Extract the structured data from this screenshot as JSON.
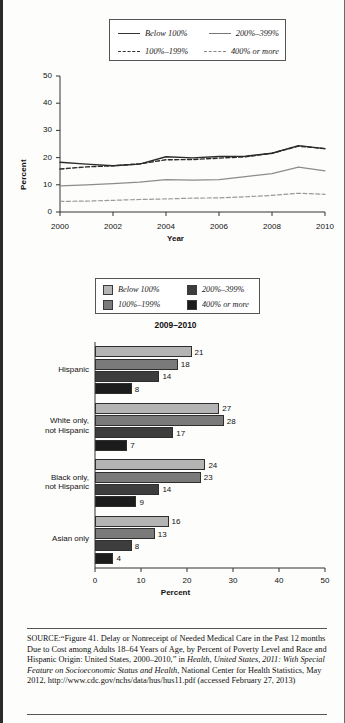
{
  "line_chart_legend": [
    {
      "label": "Below 100%",
      "style": "solid-dark"
    },
    {
      "label": "200%–399%",
      "style": "solid-light"
    },
    {
      "label": "100%–199%",
      "style": "dash-dark"
    },
    {
      "label": "400% or more",
      "style": "dash-light"
    }
  ],
  "bar_chart_legend": [
    {
      "label": "Below 100%",
      "color": "#b4b4b4"
    },
    {
      "label": "200%–399%",
      "color": "#3d3d3d"
    },
    {
      "label": "100%–199%",
      "color": "#7a7a7a"
    },
    {
      "label": "400% or more",
      "color": "#1c1c1c"
    }
  ],
  "bar_chart_title": "2009–2010",
  "source": {
    "prefix": "SOURCE:",
    "text_1": "“Figure 41. Delay or Nonreceipt of Needed Medical Care in the Past 12 months Due to Cost among Adults 18–64 Years of Age, by Percent of Poverty Level and Race and Hispanic Origin: United States, 2000–2010,” in ",
    "italic_1": "Health, United States, 2011: With Special Feature on Socioeconomic Status and Health",
    "text_2": ", National Center for Health Statistics, May 2012, http://www.cdc.gov/nchs/data/hus/hus11.pdf (accessed February 27, 2013)"
  },
  "chart_data": [
    {
      "type": "line",
      "title": "",
      "xlabel": "Year",
      "ylabel": "Percent",
      "xlim": [
        2000,
        2010
      ],
      "ylim": [
        0,
        50
      ],
      "yticks": [
        0,
        10,
        20,
        30,
        40,
        50
      ],
      "xticks": [
        2000,
        2002,
        2004,
        2006,
        2008,
        2010
      ],
      "grid": false,
      "legend_position": "top",
      "x": [
        2000,
        2001,
        2002,
        2003,
        2004,
        2005,
        2006,
        2007,
        2008,
        2009,
        2010
      ],
      "series": [
        {
          "name": "Below 100%",
          "style": "solid-dark",
          "values": [
            18.3,
            17.6,
            17.0,
            17.6,
            20.3,
            19.9,
            20.4,
            20.5,
            21.6,
            24.4,
            23.3
          ]
        },
        {
          "name": "100%–199%",
          "style": "dash-dark",
          "values": [
            15.8,
            16.6,
            17.0,
            17.7,
            19.2,
            19.3,
            19.8,
            20.3,
            21.6,
            24.2,
            23.3
          ]
        },
        {
          "name": "200%–399%",
          "style": "solid-light",
          "values": [
            9.6,
            10.0,
            10.4,
            11.0,
            11.9,
            11.7,
            11.9,
            13.0,
            14.1,
            16.5,
            15.1
          ]
        },
        {
          "name": "400% or more",
          "style": "dash-light",
          "values": [
            3.9,
            4.0,
            4.3,
            4.6,
            4.8,
            5.1,
            5.2,
            5.6,
            6.1,
            6.9,
            6.5
          ]
        }
      ]
    },
    {
      "type": "bar",
      "orientation": "horizontal",
      "title": "2009–2010",
      "xlabel": "Percent",
      "ylabel": "",
      "xlim": [
        0,
        50
      ],
      "xticks": [
        0,
        10,
        20,
        30,
        40,
        50
      ],
      "grid": false,
      "legend_position": "top",
      "categories": [
        "Hispanic",
        "White only,\nnot Hispanic",
        "Black only,\nnot Hispanic",
        "Asian only"
      ],
      "series": [
        {
          "name": "Below 100%",
          "color": "#b4b4b4",
          "values": [
            21,
            27,
            24,
            16
          ]
        },
        {
          "name": "100%–199%",
          "color": "#7a7a7a",
          "values": [
            18,
            28,
            23,
            13
          ]
        },
        {
          "name": "200%–399%",
          "color": "#3d3d3d",
          "values": [
            14,
            17,
            14,
            8
          ]
        },
        {
          "name": "400% or more",
          "color": "#1c1c1c",
          "values": [
            8,
            7,
            9,
            4
          ]
        }
      ]
    }
  ]
}
